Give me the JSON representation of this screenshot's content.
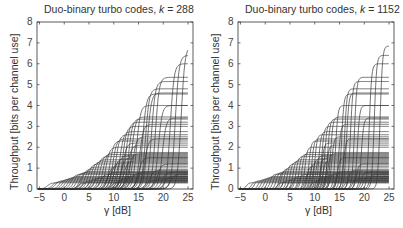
{
  "chart_data": [
    {
      "type": "line",
      "title": "Duo-binary turbo codes, k = 288",
      "title_prefix": "Duo-binary turbo codes, ",
      "title_var": "k",
      "title_value": " = 288",
      "xlabel": "γ [dB]",
      "ylabel": "Throughput [bits per channel use]",
      "xlim": [
        -5.5,
        26
      ],
      "ylim": [
        0,
        8
      ],
      "xticks": [
        -5,
        0,
        5,
        10,
        15,
        20,
        25
      ],
      "yticks": [
        0,
        1,
        2,
        3,
        4,
        5,
        6,
        7,
        8
      ],
      "grid": false,
      "legend": null,
      "series_description": "Family of throughput curves: each rises sigmoidally from 0 at threshold γ to a constant plateau rate",
      "curves": [
        {
          "rate": 0.3,
          "threshold": -4.2
        },
        {
          "rate": 0.35,
          "threshold": -3.2
        },
        {
          "rate": 0.4,
          "threshold": -2.6
        },
        {
          "rate": 0.45,
          "threshold": -1.8
        },
        {
          "rate": 0.5,
          "threshold": -1.2
        },
        {
          "rate": 0.55,
          "threshold": -0.6
        },
        {
          "rate": 0.6,
          "threshold": 0.0
        },
        {
          "rate": 0.7,
          "threshold": 0.6
        },
        {
          "rate": 0.75,
          "threshold": 1.2
        },
        {
          "rate": 0.8,
          "threshold": 1.8
        },
        {
          "rate": 0.85,
          "threshold": 2.4
        },
        {
          "rate": 0.3,
          "threshold": 2.0
        },
        {
          "rate": 0.4,
          "threshold": 3.0
        },
        {
          "rate": 0.5,
          "threshold": 4.2
        },
        {
          "rate": 0.6,
          "threshold": 5.2
        },
        {
          "rate": 0.7,
          "threshold": 6.4
        },
        {
          "rate": 0.8,
          "threshold": 7.6
        },
        {
          "rate": 0.35,
          "threshold": 8.8
        },
        {
          "rate": 0.45,
          "threshold": 9.6
        },
        {
          "rate": 0.55,
          "threshold": 10.2
        },
        {
          "rate": 0.65,
          "threshold": 11.4
        },
        {
          "rate": 0.75,
          "threshold": 12.6
        },
        {
          "rate": 0.85,
          "threshold": 13.8
        },
        {
          "rate": 0.4,
          "threshold": 15.6
        },
        {
          "rate": 0.5,
          "threshold": 17.2
        },
        {
          "rate": 0.6,
          "threshold": 19.4
        },
        {
          "rate": 0.7,
          "threshold": 20.6
        },
        {
          "rate": 0.95,
          "threshold": 2.8
        },
        {
          "rate": 1.05,
          "threshold": 3.4
        },
        {
          "rate": 1.2,
          "threshold": 4.0
        },
        {
          "rate": 1.3,
          "threshold": 4.6
        },
        {
          "rate": 1.4,
          "threshold": 5.2
        },
        {
          "rate": 1.55,
          "threshold": 5.8
        },
        {
          "rate": 1.65,
          "threshold": 6.4
        },
        {
          "rate": 1.75,
          "threshold": 7.0
        },
        {
          "rate": 1.1,
          "threshold": 8.0
        },
        {
          "rate": 1.25,
          "threshold": 8.6
        },
        {
          "rate": 1.45,
          "threshold": 9.2
        },
        {
          "rate": 1.6,
          "threshold": 9.8
        },
        {
          "rate": 1.5,
          "threshold": 10.6
        },
        {
          "rate": 1.35,
          "threshold": 11.2
        },
        {
          "rate": 1.7,
          "threshold": 12.2
        },
        {
          "rate": 2.0,
          "threshold": 7.6
        },
        {
          "rate": 2.3,
          "threshold": 8.4
        },
        {
          "rate": 2.4,
          "threshold": 9.0
        },
        {
          "rate": 2.6,
          "threshold": 9.6
        },
        {
          "rate": 2.75,
          "threshold": 10.4
        },
        {
          "rate": 2.2,
          "threshold": 11.0
        },
        {
          "rate": 2.1,
          "threshold": 12.0
        },
        {
          "rate": 2.5,
          "threshold": 13.0
        },
        {
          "rate": 3.0,
          "threshold": 11.0
        },
        {
          "rate": 3.2,
          "threshold": 11.6
        },
        {
          "rate": 3.35,
          "threshold": 12.2
        },
        {
          "rate": 3.45,
          "threshold": 12.8
        },
        {
          "rate": 3.1,
          "threshold": 14.4
        },
        {
          "rate": 4.0,
          "threshold": 13.8
        },
        {
          "rate": 4.55,
          "threshold": 15.0
        },
        {
          "rate": 4.6,
          "threshold": 16.0
        },
        {
          "rate": 4.8,
          "threshold": 15.6
        },
        {
          "rate": 5.15,
          "threshold": 16.8
        },
        {
          "rate": 5.35,
          "threshold": 17.6
        },
        {
          "rate": 6.0,
          "threshold": 20.6
        },
        {
          "rate": 6.4,
          "threshold": 21.6
        },
        {
          "rate": 6.85,
          "threshold": 22.8
        },
        {
          "rate": 4.0,
          "threshold": 18.2
        },
        {
          "rate": 3.4,
          "threshold": 19.0
        },
        {
          "rate": 2.4,
          "threshold": 15.4
        },
        {
          "rate": 1.5,
          "threshold": 14.2
        },
        {
          "rate": 0.9,
          "threshold": 16.4
        },
        {
          "rate": 1.2,
          "threshold": 18.0
        },
        {
          "rate": 0.8,
          "threshold": 19.0
        }
      ]
    },
    {
      "type": "line",
      "title": "Duo-binary turbo codes, k = 1152",
      "title_prefix": "Duo-binary turbo codes, ",
      "title_var": "k",
      "title_value": " = 1152",
      "xlabel": "γ [dB]",
      "ylabel": "Throughput [bits per channel use]",
      "xlim": [
        -5.5,
        26
      ],
      "ylim": [
        0,
        8
      ],
      "xticks": [
        -5,
        0,
        5,
        10,
        15,
        20,
        25
      ],
      "yticks": [
        0,
        1,
        2,
        3,
        4,
        5,
        6,
        7,
        8
      ],
      "grid": false,
      "legend": null,
      "series_description": "Same family of throughput curves with slightly lower thresholds and steeper transitions for the longer block length",
      "threshold_shift_db": -0.4,
      "steepness_factor": 1.6
    }
  ]
}
